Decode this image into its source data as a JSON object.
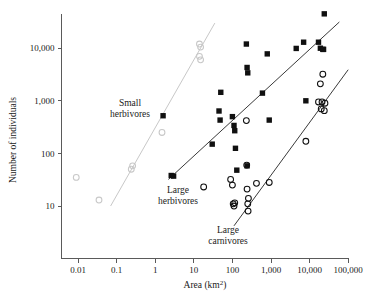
{
  "figure": {
    "width": 375,
    "height": 300,
    "background": "#ffffff"
  },
  "chart_data": {
    "type": "scatter",
    "title": "",
    "xlabel": "Area (km²)",
    "ylabel": "Number of individuals",
    "xscale": "log",
    "yscale": "log",
    "xlim": [
      0.01,
      100000
    ],
    "ylim": [
      3,
      60000
    ],
    "xticks": [
      0.01,
      0.1,
      1,
      10,
      100,
      1000,
      10000,
      100000
    ],
    "xtick_labels": [
      "0.01",
      "0.1",
      "1",
      "10",
      "100",
      "1,000",
      "10,000",
      "100,000"
    ],
    "yticks": [
      10,
      100,
      1000,
      10000
    ],
    "ytick_labels": [
      "10",
      "100",
      "1,000",
      "10,000"
    ],
    "grid": false,
    "legend": "inline-annotations",
    "series": [
      {
        "name": "Small herbivores",
        "marker": "open-circle",
        "color": "#c8c8c8",
        "points": [
          [
            0.009,
            35
          ],
          [
            0.035,
            13
          ],
          [
            0.24,
            50
          ],
          [
            0.26,
            58
          ],
          [
            1.5,
            250
          ],
          [
            14,
            12000
          ],
          [
            15,
            10500
          ],
          [
            14,
            7000
          ],
          [
            15,
            6000
          ]
        ]
      },
      {
        "name": "Large herbivores",
        "marker": "filled-square",
        "color": "#101010",
        "points": [
          [
            2.6,
            38
          ],
          [
            3.0,
            37
          ],
          [
            1.6,
            520
          ],
          [
            30,
            150
          ],
          [
            45,
            640
          ],
          [
            48,
            430
          ],
          [
            50,
            1450
          ],
          [
            100,
            500
          ],
          [
            110,
            340
          ],
          [
            115,
            270
          ],
          [
            120,
            125
          ],
          [
            130,
            48
          ],
          [
            230,
            12000
          ],
          [
            240,
            4300
          ],
          [
            250,
            3400
          ],
          [
            240,
            58
          ],
          [
            600,
            1400
          ],
          [
            800,
            7800
          ],
          [
            900,
            430
          ],
          [
            4500,
            9900
          ],
          [
            7000,
            13000
          ],
          [
            8000,
            1000
          ],
          [
            17000,
            13000
          ],
          [
            19000,
            10000
          ],
          [
            22000,
            9500
          ],
          [
            23000,
            9500
          ],
          [
            24000,
            45000
          ]
        ]
      },
      {
        "name": "Large carnivores",
        "marker": "open-circle",
        "color": "#101010",
        "points": [
          [
            18,
            23
          ],
          [
            90,
            32
          ],
          [
            100,
            25
          ],
          [
            105,
            11
          ],
          [
            110,
            10
          ],
          [
            115,
            11.5
          ],
          [
            230,
            420
          ],
          [
            235,
            60
          ],
          [
            240,
            21
          ],
          [
            250,
            11
          ],
          [
            255,
            8
          ],
          [
            260,
            14
          ],
          [
            420,
            27
          ],
          [
            900,
            28
          ],
          [
            8000,
            170
          ],
          [
            17000,
            950
          ],
          [
            19000,
            2100
          ],
          [
            20000,
            700
          ],
          [
            21000,
            950
          ],
          [
            22000,
            3200
          ],
          [
            24000,
            650
          ],
          [
            25000,
            900
          ]
        ]
      }
    ],
    "trend_lines": [
      {
        "name": "Small herbivores trend",
        "color": "#c8c8c8",
        "x_start": 0.07,
        "y_start": 10,
        "x_end": 35,
        "y_end": 30000
      },
      {
        "name": "Large herbivores trend",
        "color": "#3a3a3a",
        "x_start": 2.2,
        "y_start": 32,
        "x_end": 100000,
        "y_end": 45000
      },
      {
        "name": "Large carnivores trend",
        "color": "#3a3a3a",
        "x_start": 110,
        "y_start": 4.2,
        "x_end": 100000,
        "y_end": 3900
      }
    ],
    "annotations": [
      {
        "name": "small-herbivores-label",
        "lines": [
          "Small",
          "herbivores"
        ],
        "x_px": 130,
        "y_px": 106
      },
      {
        "name": "large-herbivores-label",
        "lines": [
          "Large",
          "herbivores"
        ],
        "x_px": 178,
        "y_px": 193
      },
      {
        "name": "large-carnivores-label",
        "lines": [
          "Large",
          "carnivores"
        ],
        "x_px": 228,
        "y_px": 233
      }
    ]
  }
}
